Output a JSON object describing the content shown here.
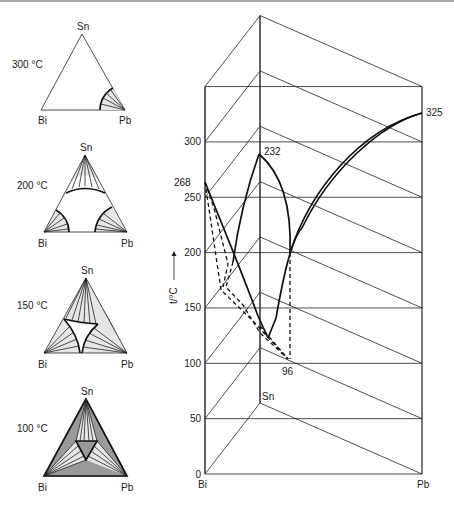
{
  "figure": {
    "components": [
      "Bi",
      "Sn",
      "Pb"
    ]
  },
  "sections": [
    {
      "temperature_label": "300 °C",
      "labels": {
        "top": "Sn",
        "left": "Bi",
        "right": "Pb"
      }
    },
    {
      "temperature_label": "200 °C",
      "labels": {
        "top": "Sn",
        "left": "Bi",
        "right": "Pb"
      }
    },
    {
      "temperature_label": "150 °C",
      "labels": {
        "top": "Sn",
        "left": "Bi",
        "right": "Pb"
      }
    },
    {
      "temperature_label": "100 °C",
      "labels": {
        "top": "Sn",
        "left": "Bi",
        "right": "Pb"
      }
    }
  ],
  "prism": {
    "axis_label": "t/°C",
    "ticks": [
      "0",
      "50",
      "100",
      "150",
      "200",
      "250",
      "300"
    ],
    "tick_values": [
      0,
      50,
      100,
      150,
      200,
      250,
      300
    ],
    "corner_labels": {
      "bi": "Bi",
      "pb": "Pb",
      "sn": "Sn"
    },
    "melting_points": [
      {
        "element": "Bi",
        "value": 268,
        "label": "268"
      },
      {
        "element": "Sn",
        "value": 232,
        "label": "232"
      },
      {
        "element": "Pb",
        "value": 325,
        "label": "325"
      }
    ],
    "eutectic": {
      "value": 96,
      "label": "96"
    }
  },
  "chart_data": {
    "type": "ternary-phase-diagram",
    "title": "",
    "ylabel": "t/°C",
    "ylim": [
      0,
      350
    ],
    "yticks": [
      0,
      50,
      100,
      150,
      200,
      250,
      300
    ],
    "melting_points": {
      "Bi": 268,
      "Sn": 232,
      "Pb": 325
    },
    "ternary_eutectic_temperature": 96,
    "isothermal_sections": [
      "300 °C",
      "200 °C",
      "150 °C",
      "100 °C"
    ]
  }
}
